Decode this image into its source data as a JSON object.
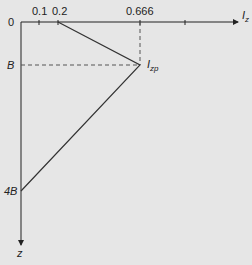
{
  "diagram": {
    "type": "influence-factor-distribution",
    "axes": {
      "horizontal": {
        "label": "I",
        "label_subscript": "z",
        "ticks": [
          "0.1",
          "0.2",
          "0.666"
        ]
      },
      "vertical": {
        "label": "z",
        "ticks": [
          "B",
          "4B"
        ]
      },
      "origin_label": "0"
    },
    "peak_point": {
      "label": "I",
      "label_subscript": "zp"
    },
    "points": [
      {
        "x": "0.2",
        "z": "0"
      },
      {
        "x": "0.666",
        "z": "B"
      },
      {
        "x": "0",
        "z": "4B"
      }
    ],
    "colors": {
      "background": "#e6e6e6",
      "line": "#333333",
      "dashed": "#555555"
    }
  }
}
